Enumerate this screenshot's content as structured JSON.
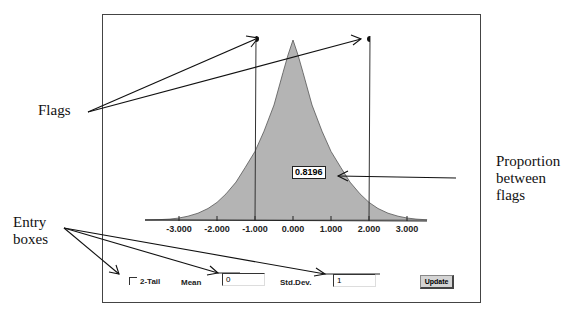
{
  "callouts": {
    "flags": "Flags",
    "entry_boxes_line1": "Entry",
    "entry_boxes_line2": "boxes",
    "proportion_line1": "Proportion",
    "proportion_line2": "between",
    "proportion_line3": "flags"
  },
  "chart": {
    "proportion_between_flags": "0.8196",
    "x_tick_labels": [
      "-3.000",
      "-2.000",
      "-1.000",
      "0.000",
      "1.000",
      "2.000",
      "3.000"
    ],
    "left_flag_value": -1,
    "right_flag_value": 2
  },
  "controls": {
    "two_tail_label": "2-Tail",
    "two_tail_checked": false,
    "mean_label": "Mean",
    "mean_value": "0",
    "stddev_label": "Std.Dev.",
    "stddev_value": "1",
    "update_label": "Update"
  },
  "colors": {
    "curve_fill": "#b4b4b4",
    "axis": "#222222"
  }
}
